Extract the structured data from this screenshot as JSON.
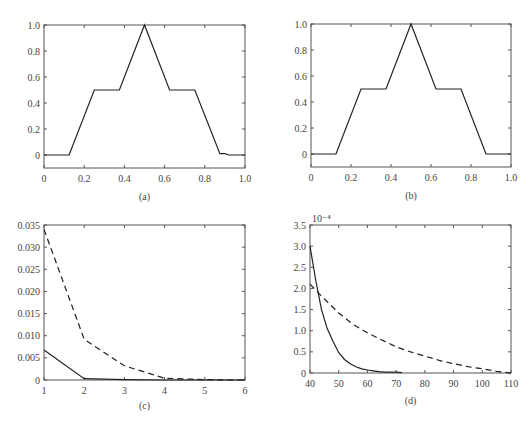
{
  "chart_data": [
    {
      "id": "a",
      "type": "line",
      "caption": "(a)",
      "title": "",
      "xlabel": "",
      "ylabel": "",
      "xlim": [
        0,
        1.0
      ],
      "ylim": [
        -0.1,
        1.0
      ],
      "xticks": [
        "0",
        "0.2",
        "0.4",
        "0.6",
        "0.8",
        "1.0"
      ],
      "yticks": [
        "0",
        "0.2",
        "0.4",
        "0.6",
        "0.8",
        "1.0"
      ],
      "grid": false,
      "series": [
        {
          "name": "approximation (a)",
          "style": "solid",
          "x": [
            0,
            0.125,
            0.25,
            0.375,
            0.5,
            0.625,
            0.75,
            0.875,
            0.9,
            0.92,
            1.0
          ],
          "y": [
            0,
            0,
            0.5,
            0.5,
            1.0,
            0.5,
            0.5,
            0.01,
            0.01,
            0.0,
            0.0
          ]
        }
      ]
    },
    {
      "id": "b",
      "type": "line",
      "caption": "(b)",
      "title": "",
      "xlabel": "",
      "ylabel": "",
      "xlim": [
        0,
        1.0
      ],
      "ylim": [
        -0.1,
        1.0
      ],
      "xticks": [
        "0",
        "0.2",
        "0.4",
        "0.6",
        "0.8",
        "1.0"
      ],
      "yticks": [
        "0",
        "0.2",
        "0.4",
        "0.6",
        "0.8",
        "1.0"
      ],
      "grid": false,
      "series": [
        {
          "name": "exact (b)",
          "style": "solid",
          "x": [
            0,
            0.125,
            0.25,
            0.375,
            0.5,
            0.625,
            0.75,
            0.875,
            1.0
          ],
          "y": [
            0,
            0,
            0.5,
            0.5,
            1.0,
            0.5,
            0.5,
            0,
            0
          ]
        }
      ]
    },
    {
      "id": "c",
      "type": "line",
      "caption": "(c)",
      "title": "",
      "xlabel": "",
      "ylabel": "",
      "xlim": [
        1,
        6
      ],
      "ylim": [
        0,
        0.035
      ],
      "xticks": [
        "1",
        "2",
        "3",
        "4",
        "5",
        "6"
      ],
      "yticks": [
        "0",
        "0.005",
        "0.010",
        "0.015",
        "0.020",
        "0.025",
        "0.030",
        "0.035"
      ],
      "grid": false,
      "series": [
        {
          "name": "solid",
          "style": "solid",
          "x": [
            1,
            2,
            3,
            4,
            5,
            6
          ],
          "y": [
            0.0068,
            0.0003,
            0.0001,
            0.0,
            0.0,
            0.0
          ]
        },
        {
          "name": "dashed",
          "style": "dashed",
          "x": [
            1,
            2,
            3,
            4,
            5,
            6
          ],
          "y": [
            0.034,
            0.0092,
            0.0032,
            0.0004,
            0.0001,
            0.0
          ]
        }
      ]
    },
    {
      "id": "d",
      "type": "line",
      "caption": "(d)",
      "title": "",
      "xlabel": "",
      "ylabel": "",
      "y_scale_label": "10⁻⁴",
      "xlim": [
        40,
        110
      ],
      "ylim": [
        0,
        3.5
      ],
      "xticks": [
        "40",
        "50",
        "60",
        "70",
        "80",
        "90",
        "100",
        "110"
      ],
      "yticks": [
        "0",
        "0.5",
        "1.0",
        "1.5",
        "2.0",
        "2.5",
        "3.0",
        "3.5"
      ],
      "grid": false,
      "series": [
        {
          "name": "solid",
          "style": "solid",
          "x": [
            40,
            42,
            44,
            46,
            48,
            50,
            52,
            54,
            56,
            58,
            60,
            62,
            64,
            66,
            68,
            70,
            72
          ],
          "y": [
            3.0,
            2.2,
            1.5,
            1.05,
            0.75,
            0.48,
            0.32,
            0.22,
            0.15,
            0.1,
            0.07,
            0.05,
            0.03,
            0.02,
            0.02,
            0.02,
            0.01
          ]
        },
        {
          "name": "dashed",
          "style": "dashed",
          "x": [
            40,
            45,
            50,
            55,
            60,
            65,
            70,
            75,
            80,
            85,
            90,
            95,
            100,
            105,
            110
          ],
          "y": [
            2.1,
            1.75,
            1.42,
            1.15,
            0.95,
            0.78,
            0.62,
            0.5,
            0.4,
            0.3,
            0.22,
            0.15,
            0.1,
            0.04,
            0.0
          ]
        }
      ]
    }
  ]
}
